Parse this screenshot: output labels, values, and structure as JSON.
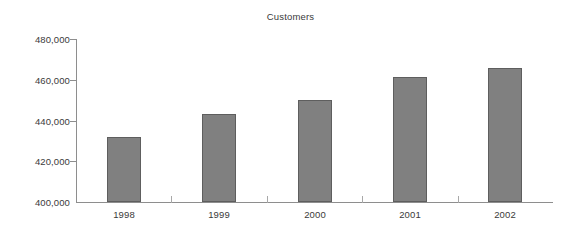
{
  "chart_data": {
    "type": "bar",
    "title": "Customers",
    "xlabel": "",
    "ylabel": "",
    "categories": [
      "1998",
      "1999",
      "2000",
      "2001",
      "2002"
    ],
    "values": [
      432000,
      443000,
      450000,
      461500,
      465800
    ],
    "series": [
      {
        "name": "Customers",
        "values": [
          432000,
          443000,
          450000,
          461500,
          465800
        ]
      }
    ],
    "ylim": [
      400000,
      480000
    ],
    "ytick_values": [
      400000,
      420000,
      440000,
      460000,
      480000
    ],
    "ytick_labels": [
      "400,000",
      "420,000",
      "440,000",
      "460,000",
      "480,000"
    ],
    "grid": false,
    "legend": false,
    "legend_position": "none",
    "bar_color": "#808080",
    "bar_border_color": "#5e5e5e",
    "axis_color": "#8e8e8e",
    "text_color": "#3a3a3a",
    "background_color": "#ffffff"
  }
}
